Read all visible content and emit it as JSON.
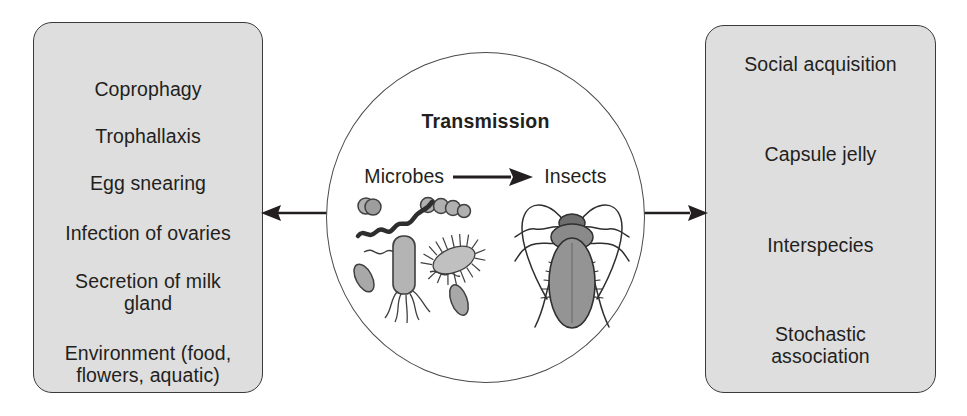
{
  "figure": {
    "center": {
      "title": "Transmission",
      "flow": {
        "source_label": "Microbes",
        "arrow_icon": "arrow-right-icon",
        "target_label": "Insects"
      },
      "illustrations": {
        "microbes_icon": "bacteria-illustration",
        "insect_icon": "cockroach-illustration"
      }
    },
    "left_panel": {
      "arrow_icon": "arrow-left-icon",
      "items": [
        {
          "label": "Coprophagy",
          "top": 55
        },
        {
          "label": "Trophallaxis",
          "top": 102
        },
        {
          "label": "Egg snearing",
          "top": 149
        },
        {
          "label": "Infection of ovaries",
          "top": 199
        },
        {
          "label": "Secretion of milk\ngland",
          "top": 247
        },
        {
          "label": "Environment (food,\nflowers, aquatic)",
          "top": 319
        }
      ]
    },
    "right_panel": {
      "arrow_icon": "arrow-right-icon",
      "items": [
        {
          "label": "Social acquisition",
          "top": 27
        },
        {
          "label": "Capsule jelly",
          "top": 117
        },
        {
          "label": "Interspecies",
          "top": 208
        },
        {
          "label": "Stochastic\nassociation",
          "top": 297
        }
      ]
    },
    "colors": {
      "panel_fill": "#dedede",
      "panel_stroke": "#3a3a3a",
      "text": "#231f20",
      "ellipse_stroke": "#4a4a4a",
      "background": "#ffffff",
      "microbe_fill": "#a8a8a8",
      "insect_fill": "#8f8f8f"
    }
  }
}
